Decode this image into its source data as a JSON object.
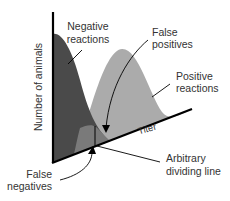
{
  "diagram": {
    "title": "",
    "y_axis_label": "Number of animals",
    "x_axis_label": "Titer",
    "labels": {
      "negative_reactions": [
        "Negative",
        "reactions"
      ],
      "false_positives": [
        "False",
        "positives"
      ],
      "positive_reactions": [
        "Positive",
        "reactions"
      ],
      "false_negatives": [
        "False",
        "negatives"
      ],
      "dividing_line": [
        "Arbitrary",
        "dividing line"
      ]
    },
    "colors": {
      "negative_curve": "#4a4a4a",
      "positive_curve": "#ababab",
      "overlap": "#7a7a7a",
      "axis": "#000000",
      "text": "#333333"
    }
  }
}
